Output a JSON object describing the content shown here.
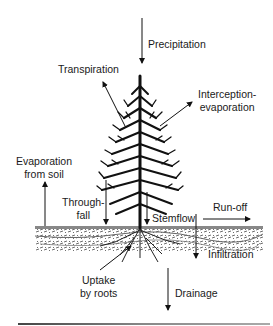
{
  "diagram": {
    "labels": {
      "precipitation": "Precipitation",
      "transpiration": "Transpiration",
      "interception_line1": "Interception-",
      "interception_line2": "evaporation",
      "evap_soil_line1": "Evaporation",
      "evap_soil_line2": "from soil",
      "throughfall_line1": "Through-",
      "throughfall_line2": "fall",
      "stemflow": "Stemflow",
      "runoff": "Run-off",
      "infiltration": "Infiltration",
      "uptake_line1": "Uptake",
      "uptake_line2": "by roots",
      "drainage": "Drainage"
    },
    "colors": {
      "ink": "#111111",
      "soil": "#555555",
      "background": "#ffffff"
    }
  }
}
